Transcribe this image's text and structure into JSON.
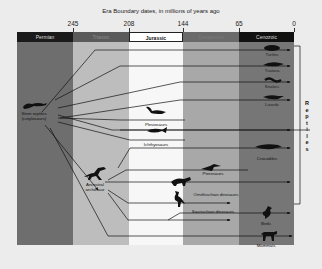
{
  "title": "Era Boundary dates, in millions of years ago",
  "ticks": [
    "245",
    "208",
    "144",
    "65",
    "0"
  ],
  "eras": [
    {
      "name": "Permian",
      "color": "#6e6e6e",
      "header": "#1a1a1a",
      "header_text": "#dddddd"
    },
    {
      "name": "Triassic",
      "color": "#bdbdbd",
      "header": "#5a5a5a",
      "header_text": "#888888"
    },
    {
      "name": "Jurassic",
      "color": "#f7f7f7",
      "header": "#ffffff",
      "header_text": "#111111"
    },
    {
      "name": "Cretaceous",
      "color": "#a8a8a8",
      "header": "#6a6a6a",
      "header_text": "#777777"
    },
    {
      "name": "Cenozoic",
      "color": "#767676",
      "header": "#111111",
      "header_text": "#dddddd"
    }
  ],
  "ancestors": {
    "stem": "Stem reptiles\n(cotylosaurs)",
    "stem_line1": "Stem reptiles",
    "stem_line2": "(cotylosaurs)",
    "archosaur_line1": "Ancestral",
    "archosaur_line2": "archosaur"
  },
  "groups": {
    "turtles": "Turtles",
    "tuatara": "Tuatara",
    "snakes": "Snakes",
    "lizards": "Lizards",
    "plesiosaurs": "Plesiosaurs",
    "ichthyosaurs": "Ichthyosaurs",
    "crocodiles": "Crocodiles",
    "pterosaurs": "Pterosaurs",
    "ornithischian": "Ornithischian dinosaurs",
    "saurischian": "Saurischian dinosaurs",
    "birds": "Birds",
    "mammals": "Mammals"
  },
  "bracket_label": [
    "R",
    "e",
    "p",
    "t",
    "i",
    "l",
    "e",
    "s"
  ]
}
